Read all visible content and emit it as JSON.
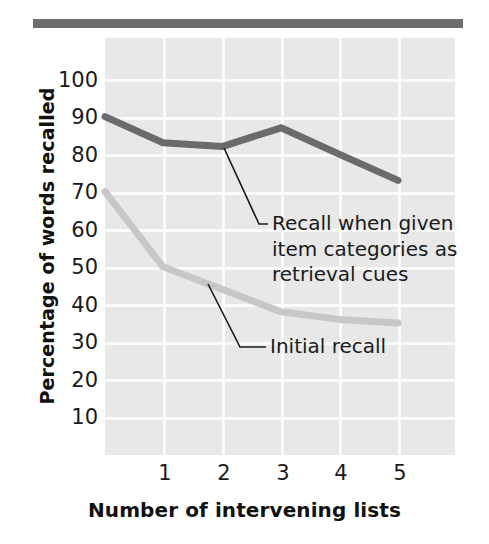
{
  "chart_data": {
    "type": "line",
    "title": "",
    "xlabel": "Number of intervening lists",
    "ylabel": "Percentage of words recalled",
    "x": [
      0,
      1,
      2,
      3,
      4,
      5
    ],
    "xtick_labels": [
      "1",
      "2",
      "3",
      "4",
      "5"
    ],
    "xticks": [
      1,
      2,
      3,
      4,
      5
    ],
    "xlim": [
      0,
      6
    ],
    "ylim": [
      0,
      110
    ],
    "yticks": [
      10,
      20,
      30,
      40,
      50,
      60,
      70,
      80,
      90,
      100
    ],
    "ytick_labels": [
      "10",
      "20",
      "30",
      "40",
      "50",
      "60",
      "70",
      "80",
      "90",
      "100"
    ],
    "grid": true,
    "legend_position": "inline-annotations",
    "series": [
      {
        "name": "Recall when given item categories as retrieval cues",
        "color": "#6b6b6d",
        "values": [
          90,
          83,
          82,
          87,
          80,
          73
        ]
      },
      {
        "name": "Initial recall",
        "color": "#c7c7c7",
        "values": [
          70,
          50,
          44,
          38,
          36,
          35
        ]
      }
    ],
    "annotations": [
      {
        "id": "cued",
        "lines": [
          "Recall when given",
          "item categories as",
          "retrieval cues"
        ],
        "points_to_series": "Recall when given item categories as retrieval cues",
        "points_to_x": 2
      },
      {
        "id": "initial",
        "lines": [
          "Initial recall"
        ],
        "points_to_series": "Initial recall",
        "points_to_x": 1.35
      }
    ]
  },
  "figure": {
    "top_rule_color": "#6e6e70",
    "panel_color": "#e8e8e8",
    "gridline_color": "#fbfbfb"
  }
}
